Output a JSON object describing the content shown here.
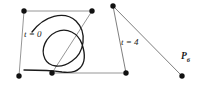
{
  "figure": {
    "background_color": "#ffffff",
    "curve_color": "#1a1a1a",
    "polygon_color": "#7a7a7a",
    "point_color": "#111111",
    "labels": {
      "start_param": "t = 0",
      "end_param": "t = 4",
      "endpoint_name": "P",
      "endpoint_subscript": "6"
    },
    "control_points": [
      {
        "name": "P0",
        "x": 19,
        "y": 76
      },
      {
        "name": "P1",
        "x": 24,
        "y": 11
      },
      {
        "name": "P2",
        "x": 92,
        "y": 11
      },
      {
        "name": "P3",
        "x": 52,
        "y": 73
      },
      {
        "name": "P4",
        "x": 126,
        "y": 73
      },
      {
        "name": "P5",
        "x": 113,
        "y": 6
      },
      {
        "name": "P6",
        "x": 182,
        "y": 76
      }
    ],
    "polygon_segments": [
      {
        "from": "P0",
        "to": "P1",
        "shade": "gray"
      },
      {
        "from": "P1",
        "to": "P2",
        "shade": "gray"
      },
      {
        "from": "P2",
        "to": "P3",
        "shade": "gray"
      },
      {
        "from": "P3",
        "to": "P4",
        "shade": "gray"
      },
      {
        "from": "P4",
        "to": "P5",
        "shade": "gray"
      },
      {
        "from": "P5",
        "to": "P6",
        "shade": "gray"
      }
    ],
    "curve_path": "M 33 31 C 47 16 66 13 76 24 C 87 36 83 52 72 60 C 60 69 48 68 44 60 C 39 50 44 38 54 32 C 65 26 76 31 80 41 C 84 52 82 62 78 67 C 74 72 68 73 62 72 C 46 70 30 70 22 70",
    "curve_stroke_width": 1.3,
    "polygon_stroke_width": 0.9,
    "point_radius": 2.6
  }
}
